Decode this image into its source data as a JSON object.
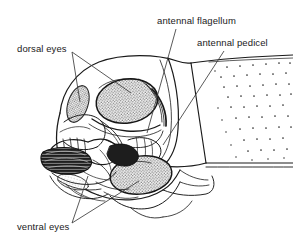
{
  "figure": {
    "background_color": "#ffffff",
    "ink_color": "#1a1a1a",
    "stipple_color": "#9a9a9a",
    "dark_fill_color": "#262626"
  },
  "labels": [
    {
      "id": "dorsal-eyes",
      "text": "dorsal eyes",
      "x": 17,
      "y": 43,
      "leaders": [
        {
          "from": [
            72,
            52
          ],
          "to": [
            80,
            102
          ]
        },
        {
          "from": [
            72,
            52
          ],
          "to": [
            131,
            93
          ]
        }
      ]
    },
    {
      "id": "antennal-flagellum",
      "text": "antennal flagellum",
      "x": 157,
      "y": 15,
      "leaders": [
        {
          "from": [
            176,
            29
          ],
          "to": [
            147,
            133
          ]
        }
      ]
    },
    {
      "id": "antennal-pedicel",
      "text": "antennal pedicel",
      "x": 197,
      "y": 37,
      "leaders": [
        {
          "from": [
            224,
            51
          ],
          "to": [
            163,
            145
          ]
        }
      ]
    },
    {
      "id": "ventral-eyes",
      "text": "ventral eyes",
      "x": 17,
      "y": 221,
      "leaders": [
        {
          "from": [
            72,
            223
          ],
          "to": [
            88,
            176
          ]
        },
        {
          "from": [
            72,
            223
          ],
          "to": [
            139,
            181
          ]
        }
      ]
    }
  ],
  "structures": {
    "dorsal_eye_main": "large stippled oval compound eye, upper centre of head",
    "dorsal_eye_left": "small stippled oval compound eye, upper left of head",
    "ventral_eye_main": "large stippled oval compound eye, lower centre of head",
    "antenna": "segmented antenna projecting to the left with ringed flagellum",
    "mouthparts": "dark hatched mandibles and maxillary palps at lower left",
    "thorax": "punctate (dotted) pronotum panel at right"
  }
}
